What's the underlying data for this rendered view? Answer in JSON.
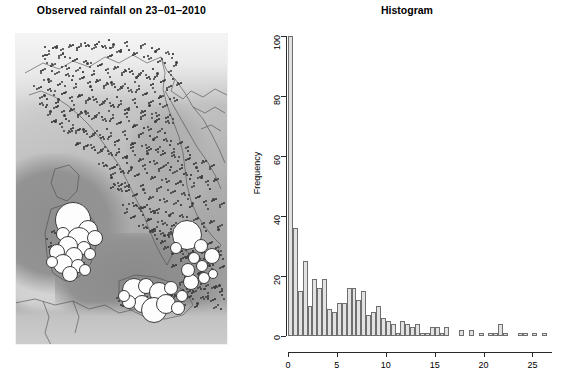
{
  "map_panel": {
    "title": "Observed rainfall on 23−01‒2010",
    "region": "Italy",
    "colors": {
      "gauge_dot": "#3b3b3b",
      "high_rain_circle": "#fdfdfd",
      "sea": "#8e8e8e",
      "land": "#bdbdbd"
    },
    "legend_note": "",
    "gauge_dots": [
      [
        34,
        18
      ],
      [
        41,
        14
      ],
      [
        48,
        20
      ],
      [
        55,
        12
      ],
      [
        62,
        17
      ],
      [
        70,
        10
      ],
      [
        77,
        16
      ],
      [
        84,
        9
      ],
      [
        91,
        15
      ],
      [
        98,
        11
      ],
      [
        105,
        18
      ],
      [
        112,
        13
      ],
      [
        119,
        20
      ],
      [
        126,
        15
      ],
      [
        133,
        23
      ],
      [
        140,
        18
      ],
      [
        147,
        26
      ],
      [
        154,
        21
      ],
      [
        161,
        29
      ],
      [
        96,
        23
      ],
      [
        30,
        26
      ],
      [
        37,
        31
      ],
      [
        44,
        25
      ],
      [
        51,
        33
      ],
      [
        58,
        28
      ],
      [
        65,
        35
      ],
      [
        72,
        30
      ],
      [
        79,
        38
      ],
      [
        86,
        32
      ],
      [
        93,
        40
      ],
      [
        100,
        34
      ],
      [
        107,
        42
      ],
      [
        114,
        36
      ],
      [
        121,
        44
      ],
      [
        128,
        38
      ],
      [
        135,
        46
      ],
      [
        142,
        40
      ],
      [
        149,
        48
      ],
      [
        156,
        42
      ],
      [
        163,
        50
      ],
      [
        26,
        40
      ],
      [
        33,
        46
      ],
      [
        40,
        41
      ],
      [
        47,
        49
      ],
      [
        54,
        43
      ],
      [
        61,
        51
      ],
      [
        68,
        45
      ],
      [
        75,
        53
      ],
      [
        82,
        47
      ],
      [
        89,
        55
      ],
      [
        96,
        49
      ],
      [
        103,
        57
      ],
      [
        110,
        51
      ],
      [
        117,
        59
      ],
      [
        124,
        53
      ],
      [
        131,
        61
      ],
      [
        138,
        55
      ],
      [
        145,
        63
      ],
      [
        152,
        57
      ],
      [
        159,
        65
      ],
      [
        22,
        56
      ],
      [
        29,
        62
      ],
      [
        36,
        58
      ],
      [
        43,
        66
      ],
      [
        50,
        60
      ],
      [
        57,
        68
      ],
      [
        64,
        62
      ],
      [
        71,
        70
      ],
      [
        78,
        64
      ],
      [
        85,
        72
      ],
      [
        92,
        66
      ],
      [
        99,
        74
      ],
      [
        106,
        68
      ],
      [
        113,
        76
      ],
      [
        120,
        70
      ],
      [
        127,
        78
      ],
      [
        134,
        72
      ],
      [
        141,
        80
      ],
      [
        148,
        74
      ],
      [
        155,
        82
      ],
      [
        28,
        72
      ],
      [
        35,
        78
      ],
      [
        42,
        74
      ],
      [
        49,
        82
      ],
      [
        56,
        76
      ],
      [
        63,
        84
      ],
      [
        70,
        78
      ],
      [
        77,
        86
      ],
      [
        84,
        80
      ],
      [
        91,
        88
      ],
      [
        98,
        82
      ],
      [
        105,
        90
      ],
      [
        112,
        84
      ],
      [
        119,
        92
      ],
      [
        126,
        86
      ],
      [
        133,
        94
      ],
      [
        140,
        88
      ],
      [
        147,
        96
      ],
      [
        154,
        90
      ],
      [
        58,
        92
      ],
      [
        40,
        88
      ],
      [
        47,
        94
      ],
      [
        54,
        98
      ],
      [
        61,
        100
      ],
      [
        68,
        96
      ],
      [
        75,
        104
      ],
      [
        82,
        98
      ],
      [
        89,
        106
      ],
      [
        96,
        100
      ],
      [
        103,
        108
      ],
      [
        110,
        102
      ],
      [
        117,
        110
      ],
      [
        124,
        104
      ],
      [
        131,
        112
      ],
      [
        138,
        106
      ],
      [
        145,
        114
      ],
      [
        152,
        108
      ],
      [
        159,
        116
      ],
      [
        166,
        110
      ],
      [
        173,
        118
      ],
      [
        62,
        110
      ],
      [
        69,
        116
      ],
      [
        76,
        112
      ],
      [
        83,
        120
      ],
      [
        90,
        114
      ],
      [
        97,
        122
      ],
      [
        104,
        116
      ],
      [
        111,
        124
      ],
      [
        118,
        118
      ],
      [
        125,
        126
      ],
      [
        132,
        120
      ],
      [
        139,
        128
      ],
      [
        146,
        122
      ],
      [
        153,
        130
      ],
      [
        160,
        124
      ],
      [
        167,
        132
      ],
      [
        174,
        126
      ],
      [
        181,
        134
      ],
      [
        188,
        128
      ],
      [
        195,
        136
      ],
      [
        88,
        130
      ],
      [
        95,
        136
      ],
      [
        102,
        132
      ],
      [
        109,
        140
      ],
      [
        116,
        134
      ],
      [
        123,
        142
      ],
      [
        130,
        136
      ],
      [
        137,
        144
      ],
      [
        144,
        138
      ],
      [
        151,
        146
      ],
      [
        158,
        140
      ],
      [
        165,
        148
      ],
      [
        172,
        142
      ],
      [
        179,
        150
      ],
      [
        186,
        144
      ],
      [
        193,
        152
      ],
      [
        200,
        146
      ],
      [
        96,
        144
      ],
      [
        103,
        150
      ],
      [
        110,
        154
      ],
      [
        100,
        152
      ],
      [
        107,
        158
      ],
      [
        114,
        154
      ],
      [
        121,
        162
      ],
      [
        128,
        156
      ],
      [
        135,
        164
      ],
      [
        142,
        158
      ],
      [
        149,
        166
      ],
      [
        156,
        160
      ],
      [
        163,
        168
      ],
      [
        170,
        162
      ],
      [
        177,
        170
      ],
      [
        184,
        164
      ],
      [
        191,
        172
      ],
      [
        198,
        166
      ],
      [
        205,
        174
      ],
      [
        118,
        170
      ],
      [
        125,
        176
      ],
      [
        132,
        172
      ],
      [
        139,
        180
      ],
      [
        112,
        176
      ],
      [
        119,
        184
      ],
      [
        126,
        178
      ],
      [
        133,
        186
      ],
      [
        140,
        180
      ],
      [
        147,
        188
      ],
      [
        154,
        182
      ],
      [
        161,
        190
      ],
      [
        168,
        184
      ],
      [
        175,
        192
      ],
      [
        182,
        186
      ],
      [
        189,
        194
      ],
      [
        196,
        188
      ],
      [
        203,
        196
      ],
      [
        128,
        192
      ],
      [
        135,
        198
      ],
      [
        142,
        194
      ],
      [
        149,
        202
      ],
      [
        156,
        196
      ],
      [
        163,
        204
      ],
      [
        140,
        202
      ],
      [
        147,
        208
      ],
      [
        154,
        204
      ],
      [
        161,
        212
      ],
      [
        168,
        206
      ],
      [
        175,
        214
      ],
      [
        182,
        208
      ],
      [
        189,
        216
      ],
      [
        196,
        210
      ],
      [
        203,
        218
      ],
      [
        150,
        214
      ],
      [
        157,
        220
      ],
      [
        164,
        216
      ],
      [
        171,
        224
      ],
      [
        178,
        218
      ],
      [
        185,
        226
      ],
      [
        192,
        220
      ],
      [
        199,
        228
      ],
      [
        206,
        222
      ],
      [
        158,
        232
      ],
      [
        166,
        228
      ],
      [
        173,
        236
      ],
      [
        180,
        230
      ],
      [
        187,
        238
      ],
      [
        194,
        232
      ],
      [
        201,
        240
      ],
      [
        208,
        234
      ],
      [
        170,
        244
      ],
      [
        177,
        248
      ],
      [
        184,
        242
      ],
      [
        190,
        250
      ],
      [
        197,
        244
      ],
      [
        204,
        252
      ],
      [
        186,
        256
      ],
      [
        193,
        260
      ],
      [
        200,
        254
      ],
      [
        207,
        262
      ],
      [
        178,
        258
      ],
      [
        165,
        252
      ],
      [
        172,
        256
      ],
      [
        196,
        268
      ],
      [
        203,
        272
      ],
      [
        189,
        266
      ],
      [
        182,
        270
      ],
      [
        175,
        264
      ],
      [
        168,
        268
      ],
      [
        160,
        262
      ],
      [
        153,
        266
      ],
      [
        146,
        272
      ],
      [
        139,
        268
      ],
      [
        132,
        264
      ],
      [
        125,
        270
      ],
      [
        118,
        266
      ],
      [
        111,
        272
      ],
      [
        104,
        268
      ],
      [
        150,
        252
      ],
      [
        143,
        256
      ],
      [
        136,
        250
      ],
      [
        129,
        256
      ],
      [
        122,
        252
      ],
      [
        40,
        200
      ],
      [
        46,
        206
      ],
      [
        52,
        202
      ],
      [
        58,
        210
      ],
      [
        64,
        204
      ],
      [
        70,
        212
      ],
      [
        47,
        214
      ],
      [
        53,
        220
      ],
      [
        59,
        216
      ],
      [
        44,
        224
      ],
      [
        50,
        228
      ],
      [
        56,
        222
      ],
      [
        62,
        230
      ],
      [
        48,
        236
      ],
      [
        54,
        240
      ],
      [
        60,
        234
      ],
      [
        42,
        232
      ],
      [
        66,
        226
      ],
      [
        38,
        218
      ],
      [
        36,
        210
      ]
    ],
    "high_rain_circles": [
      [
        57,
        186,
        17
      ],
      [
        72,
        196,
        9
      ],
      [
        47,
        200,
        6
      ],
      [
        63,
        205,
        11
      ],
      [
        79,
        204,
        7
      ],
      [
        52,
        212,
        9
      ],
      [
        68,
        214,
        6
      ],
      [
        41,
        218,
        7
      ],
      [
        58,
        222,
        8
      ],
      [
        74,
        220,
        5
      ],
      [
        47,
        230,
        9
      ],
      [
        62,
        232,
        6
      ],
      [
        36,
        228,
        5
      ],
      [
        54,
        240,
        7
      ],
      [
        69,
        236,
        5
      ],
      [
        171,
        201,
        14
      ],
      [
        185,
        212,
        6
      ],
      [
        160,
        214,
        5
      ],
      [
        196,
        222,
        7
      ],
      [
        178,
        224,
        5
      ],
      [
        118,
        256,
        11
      ],
      [
        130,
        252,
        7
      ],
      [
        143,
        258,
        9
      ],
      [
        155,
        254,
        6
      ],
      [
        166,
        262,
        5
      ],
      [
        126,
        270,
        8
      ],
      [
        138,
        276,
        12
      ],
      [
        150,
        270,
        9
      ],
      [
        162,
        274,
        6
      ],
      [
        113,
        268,
        6
      ],
      [
        175,
        248,
        7
      ],
      [
        188,
        244,
        5
      ],
      [
        108,
        262,
        5
      ],
      [
        172,
        236,
        6
      ],
      [
        186,
        232,
        5
      ],
      [
        197,
        240,
        4
      ]
    ]
  },
  "histogram": {
    "title": "Histogram",
    "plot_colors": {
      "bar_fill": "#e2e2e2",
      "bar_border": "#6f6f6f",
      "axis": "#2b2b2b"
    }
  },
  "chart_data": {
    "type": "bar",
    "title": "Histogram",
    "xlabel": "",
    "ylabel": "Frequency",
    "xlim": [
      0,
      27
    ],
    "ylim": [
      0,
      100
    ],
    "bin_width": 0.5,
    "xticks": [
      0,
      5,
      10,
      15,
      20,
      25
    ],
    "yticks": [
      0,
      20,
      40,
      60,
      80,
      100
    ],
    "grid": false,
    "legend": null,
    "bin_starts": [
      0,
      0.5,
      1,
      1.5,
      2,
      2.5,
      3,
      3.5,
      4,
      4.5,
      5,
      5.5,
      6,
      6.5,
      7,
      7.5,
      8,
      8.5,
      9,
      9.5,
      10,
      10.5,
      11,
      11.5,
      12,
      12.5,
      13,
      13.5,
      14,
      14.5,
      15,
      15.5,
      16,
      16.5,
      17,
      17.5,
      18,
      18.5,
      19,
      19.5,
      20,
      20.5,
      21,
      21.5,
      22,
      22.5,
      23,
      23.5,
      24,
      24.5,
      25,
      25.5,
      26,
      26.5
    ],
    "values": [
      100,
      36,
      15,
      25,
      10,
      19,
      16,
      19,
      9,
      8,
      11,
      11,
      16,
      16,
      12,
      15,
      7,
      8,
      10,
      6,
      5,
      4,
      1,
      5,
      4,
      3,
      4,
      1,
      1,
      3,
      3,
      1,
      3,
      0,
      0,
      2,
      0,
      2,
      0,
      1,
      0,
      1,
      1,
      4,
      1,
      0,
      0,
      1,
      1,
      0,
      1,
      0,
      1,
      0
    ]
  }
}
